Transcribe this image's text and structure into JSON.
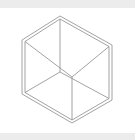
{
  "diagram": {
    "type": "wireframe-cube",
    "stroke_color": "#8a8a8a",
    "strip_color": "#ececec",
    "vertices": {
      "top": [
        60,
        16
      ],
      "upper_left": [
        22,
        40
      ],
      "lower_left": [
        22,
        94
      ],
      "bottom": [
        72,
        123
      ],
      "lower_right": [
        112,
        100
      ],
      "upper_right": [
        112,
        45
      ],
      "front_inner": [
        72,
        77
      ],
      "back_inner": [
        60,
        72
      ]
    }
  }
}
